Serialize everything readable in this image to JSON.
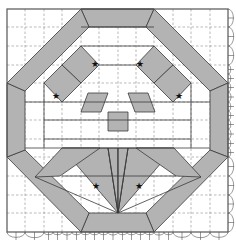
{
  "diagram": {
    "type": "origami crease pattern",
    "colors": {
      "shaded": "#b3b3b3",
      "line": "#3a3a3a",
      "dashed": "#8a8a8a",
      "background": "#ffffff"
    },
    "symbols": {
      "reference_point": "★",
      "reference_point_count": 8
    },
    "grid_divisions": 12
  }
}
